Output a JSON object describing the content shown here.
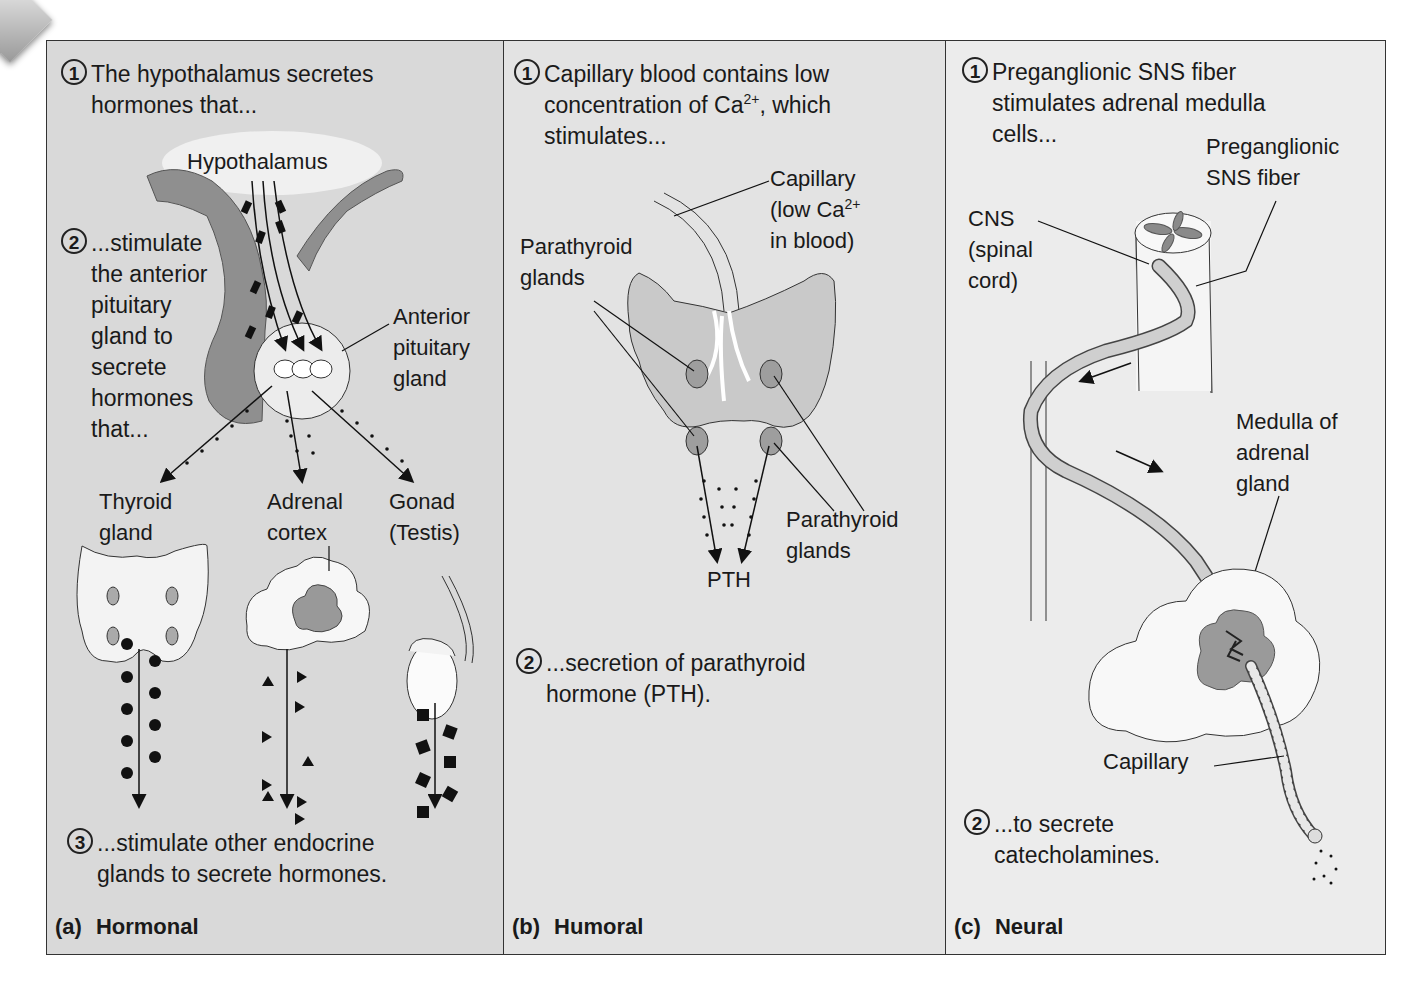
{
  "figure": {
    "panels": [
      {
        "id": "a",
        "caption_letter": "(a)",
        "caption_title": "Hormonal",
        "step1_num": "1",
        "step1_text": "The hypothalamus secretes\nhormones that...",
        "step2_num": "2",
        "step2_text": "...stimulate\nthe anterior\npituitary\ngland to\nsecrete\nhormones\nthat...",
        "step3_num": "3",
        "step3_text": "...stimulate other endocrine\nglands to secrete hormones.",
        "labels": {
          "hypothalamus": "Hypothalamus",
          "anterior_pituitary": "Anterior\npituitary\ngland",
          "thyroid": "Thyroid\ngland",
          "adrenal_cortex": "Adrenal\ncortex",
          "gonad": "Gonad\n(Testis)"
        },
        "colors": {
          "background": "#d9d9d9",
          "tissue_dark": "#8f8f8f",
          "tissue_light": "#f2f2f2"
        }
      },
      {
        "id": "b",
        "caption_letter": "(b)",
        "caption_title": "Humoral",
        "step1_num": "1",
        "step1_line1": "Capillary blood contains low",
        "step1_line2_pre": "concentration of Ca",
        "step1_line2_sup": "2+",
        "step1_line2_post": ", which",
        "step1_line3": "stimulates...",
        "step2_num": "2",
        "step2_text": "...secretion of parathyroid\nhormone (PTH).",
        "labels": {
          "capillary_line1": "Capillary",
          "capillary_line2_pre": "(low Ca",
          "capillary_line2_sup": "2+",
          "capillary_line3": "in blood)",
          "parathyroid_top": "Parathyroid\nglands",
          "parathyroid_bottom": "Parathyroid\nglands",
          "pth": "PTH"
        },
        "colors": {
          "background": "#e3e3e3",
          "thyroid": "#c9c9c9",
          "parathyroid": "#9e9e9e"
        }
      },
      {
        "id": "c",
        "caption_letter": "(c)",
        "caption_title": "Neural",
        "step1_num": "1",
        "step1_text": "Preganglionic SNS fiber\nstimulates adrenal medulla\ncells...",
        "step2_num": "2",
        "step2_text": "...to secrete\ncatecholamines.",
        "labels": {
          "preganglionic": "Preganglionic\nSNS fiber",
          "cns": "CNS\n(spinal\ncord)",
          "medulla": "Medulla of\nadrenal\ngland",
          "capillary": "Capillary"
        },
        "colors": {
          "background": "#ececec",
          "fiber": "#cfcfcf",
          "medulla": "#9a9a9a"
        }
      }
    ]
  }
}
